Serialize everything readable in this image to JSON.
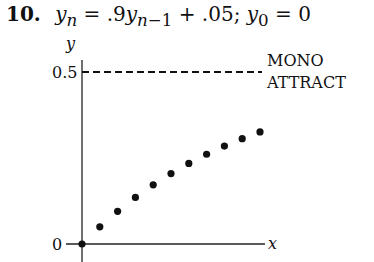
{
  "problem": {
    "number": "10.",
    "equation": "y_n = .9y_{n−1} + .05; y_0 = 0"
  },
  "annotation": [
    "MONO",
    "ATTRACT"
  ],
  "chart_data": {
    "type": "scatter",
    "xlabel": "x",
    "ylabel": "y",
    "ytick_labels": [
      "0",
      "0.5"
    ],
    "ylim": [
      0,
      0.5
    ],
    "x": [
      0,
      1,
      2,
      3,
      4,
      5,
      6,
      7,
      8,
      9,
      10
    ],
    "values": [
      0,
      0.05,
      0.095,
      0.1355,
      0.172,
      0.2048,
      0.2343,
      0.2609,
      0.2848,
      0.3063,
      0.3257
    ],
    "reference_line": {
      "y": 0.5,
      "style": "dashed",
      "label": "MONO ATTRACT"
    },
    "grid": false
  }
}
